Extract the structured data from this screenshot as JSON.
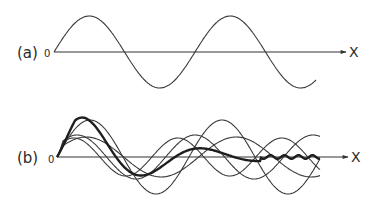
{
  "panels": [
    {
      "id": "a",
      "label": "(a)",
      "origin_label": "0",
      "axis_label": "X",
      "origin": {
        "x": 54,
        "y": 52
      },
      "axis_end_x": 346,
      "waves": [
        {
          "type": "thin",
          "amplitude": 36,
          "wavelength": 141,
          "phase": 0,
          "x_end": 316
        }
      ]
    },
    {
      "id": "b",
      "label": "(b)",
      "origin_label": "0",
      "axis_label": "X",
      "origin": {
        "x": 57,
        "y": 157
      },
      "axis_end_x": 348,
      "waves": [
        {
          "type": "thin",
          "amplitude": 37,
          "wavelength": 132,
          "phase": 0,
          "x_end": 320
        },
        {
          "type": "thin",
          "amplitude": 20,
          "wavelength": 150,
          "phase": 0.35,
          "x_end": 320
        },
        {
          "type": "thin",
          "amplitude": 22,
          "wavelength": 118,
          "phase": 0.5,
          "x_end": 320
        },
        {
          "type": "thin",
          "amplitude": 19,
          "wavelength": 104,
          "phase": 0.55,
          "x_end": 320
        }
      ],
      "packet": {
        "type": "bold",
        "amplitude": 56,
        "wavelength": 118,
        "decay_length": 78,
        "tail_start": 260,
        "x_end": 320
      }
    }
  ],
  "colors": {
    "line": "#333333",
    "bold_line": "#1e1e1e",
    "background": "#ffffff"
  }
}
